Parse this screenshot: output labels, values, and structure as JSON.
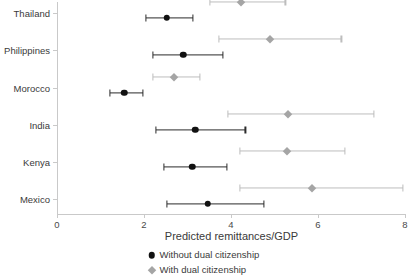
{
  "chart_data": {
    "type": "scatter",
    "title": "",
    "subtitle": "",
    "xlabel": "Predicted remittances/GDP",
    "ylabel": "",
    "xlim": [
      0,
      8
    ],
    "xticks": [
      0,
      2,
      4,
      6,
      8
    ],
    "xtick_labels": [
      "0",
      "2",
      "4",
      "6",
      "8"
    ],
    "grid": false,
    "legend_position": "bottom-center",
    "orientation": "horizontal",
    "plot_style": "dot-and-whisker confidence intervals",
    "categories": [
      "Thailand",
      "Philippines",
      "Morocco",
      "India",
      "Kenya",
      "Mexico"
    ],
    "series": [
      {
        "name": "Without dual citizenship",
        "marker": "circle",
        "color": "#111111",
        "values": [
          2.52,
          2.9,
          1.55,
          3.18,
          3.11,
          3.46
        ],
        "ci_low": [
          2.05,
          2.21,
          1.22,
          2.28,
          2.45,
          2.52
        ],
        "ci_high": [
          3.13,
          3.81,
          1.98,
          4.33,
          3.91,
          4.75
        ]
      },
      {
        "name": "With dual citizenship",
        "marker": "diamond",
        "color": "#a5a5a5",
        "values": [
          4.24,
          4.89,
          2.68,
          5.32,
          5.29,
          5.86
        ],
        "ci_low": [
          3.51,
          3.72,
          2.21,
          3.93,
          4.21,
          4.21
        ],
        "ci_high": [
          5.25,
          6.54,
          3.29,
          7.29,
          6.61,
          7.95
        ]
      }
    ],
    "legend_entries": [
      "Without dual citizenship",
      "With dual citizenship"
    ]
  },
  "legend": {
    "items": [
      {
        "label": "Without dual citizenship",
        "marker": "circle-marker-icon"
      },
      {
        "label": "With dual citizenship",
        "marker": "diamond-marker-icon"
      }
    ]
  },
  "colors": {
    "dark_series": "#111111",
    "light_series": "#a5a5a5",
    "axis": "#c9c9c9",
    "text": "#3a3a3a",
    "background": "#ffffff"
  }
}
